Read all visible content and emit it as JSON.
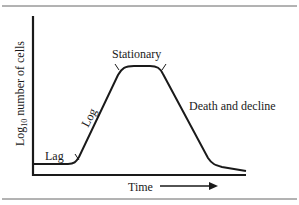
{
  "diagram": {
    "y_axis_label_prefix": "Log",
    "y_axis_label_subscript": "10",
    "y_axis_label_suffix": " number of cells",
    "x_axis_label": "Time",
    "phases": [
      {
        "name": "lag",
        "label": "Lag"
      },
      {
        "name": "log",
        "label": "Log"
      },
      {
        "name": "stationary",
        "label": "Stationary"
      },
      {
        "name": "death",
        "label": "Death and decline"
      }
    ],
    "colors": {
      "line": "#1a1a1a",
      "rule": "#555555",
      "background": "#ffffff"
    }
  }
}
